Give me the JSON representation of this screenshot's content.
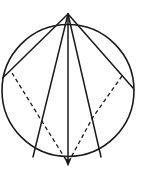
{
  "figure": {
    "background_color": "#ffffff",
    "stroke_color": "#1a1a1a",
    "canvas": {
      "width": 142,
      "height": 194
    },
    "circle": {
      "label": "circle-outline",
      "cx": 68,
      "cy": 90.5,
      "r": 66,
      "stroke_width": 1.6
    },
    "points": {
      "apex": {
        "label": "apex-vertex",
        "x": 68,
        "y": 14
      },
      "bottom": {
        "label": "bottom-vertex",
        "x": 68,
        "y": 166
      },
      "left_rim": {
        "label": "left-rim-point",
        "x": 2.6,
        "y": 78
      },
      "right_rim": {
        "label": "right-rim-point",
        "x": 133,
        "y": 88
      },
      "left_base": {
        "label": "left-base-point",
        "x": 33,
        "y": 157
      },
      "right_base": {
        "label": "right-base-point",
        "x": 101,
        "y": 157
      },
      "left_mid": {
        "label": "left-mid-point",
        "x": 38,
        "y": 115
      },
      "right_mid": {
        "label": "right-mid-point",
        "x": 93,
        "y": 117
      }
    },
    "solid_lines": [
      {
        "label": "chord-apex-to-left-rim",
        "d": "M 68 14 L 2.6 78",
        "stroke_width": 1.5
      },
      {
        "label": "chord-apex-to-right-rim",
        "d": "M 68 14 L 133 88",
        "stroke_width": 1.5
      },
      {
        "label": "chord-apex-to-left-base",
        "d": "M 68 14 L 33 157",
        "stroke_width": 1.5
      },
      {
        "label": "chord-apex-to-right-base",
        "d": "M 68 14 L 101 157",
        "stroke_width": 1.5
      },
      {
        "label": "vertical-axis-apex-to-bottom",
        "d": "M 68 14 L 68 163",
        "stroke_width": 1.5
      }
    ],
    "dashed_lines": [
      {
        "label": "dashed-left-vee",
        "d": "M 12 73 L 38 115 L 68 163",
        "stroke_width": 1.3,
        "dash_pattern": "4 3"
      },
      {
        "label": "dashed-right-vee",
        "d": "M 122 76 L 93 117 L 68 163",
        "stroke_width": 1.3,
        "dash_pattern": "4 3"
      }
    ],
    "arrows": [
      {
        "label": "down-arrowhead-vertical",
        "d": "M 68 166.5 L 64.3 157.5 L 68 159.6 L 71.7 157.5 Z"
      }
    ]
  }
}
